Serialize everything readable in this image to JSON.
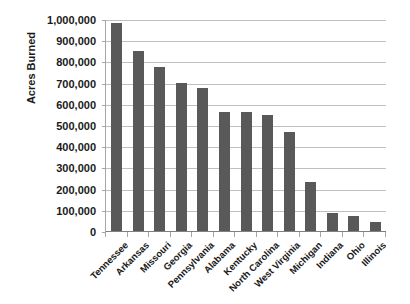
{
  "chart_data": {
    "type": "bar",
    "title": "",
    "xlabel": "",
    "ylabel": "Acres Burned",
    "ylim": [
      0,
      1000000
    ],
    "grid": true,
    "legend": "none",
    "orientation": "vertical",
    "bar_color": "#595959",
    "gridline_color": "#bfbfbf",
    "axis_color": "#a6a6a6",
    "categories": [
      "Tennessee",
      "Arkansas",
      "Missouri",
      "Georgia",
      "Pennsylvania",
      "Alabama",
      "Kentucky",
      "North Carolina",
      "West Virginia",
      "Michigan",
      "Indiana",
      "Ohio",
      "Illinois"
    ],
    "values": [
      985000,
      855000,
      780000,
      705000,
      680000,
      565000,
      565000,
      550000,
      470000,
      235000,
      88000,
      75000,
      45000
    ],
    "ytick_values": [
      1000000,
      900000,
      800000,
      700000,
      600000,
      500000,
      400000,
      300000,
      200000,
      100000,
      0
    ],
    "ytick_labels": [
      "1,000,000",
      "900,000",
      "800,000",
      "700,000",
      "600,000",
      "500,000",
      "400,000",
      "300,000",
      "200,000",
      "100,000",
      "0"
    ]
  }
}
